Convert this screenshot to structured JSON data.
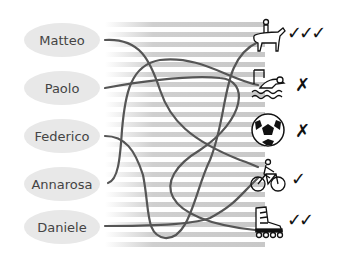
{
  "names": [
    "Matteo",
    "Paolo",
    "Federico",
    "Annarosa",
    "Daniele"
  ],
  "sports": [
    {
      "icon": "horse-rider-icon",
      "rating": "✓✓✓"
    },
    {
      "icon": "swimmer-icon",
      "rating": "✗"
    },
    {
      "icon": "soccer-ball-icon",
      "rating": "✗"
    },
    {
      "icon": "cyclist-icon",
      "rating": "✓"
    },
    {
      "icon": "inline-skate-icon",
      "rating": "✓✓"
    }
  ]
}
